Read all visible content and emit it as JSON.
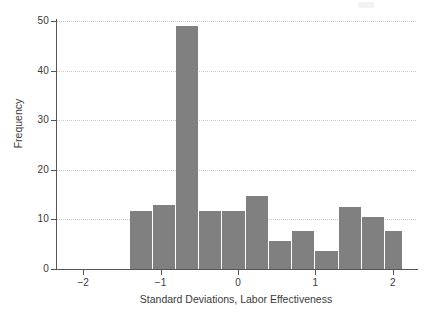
{
  "chart_data": {
    "type": "bar",
    "title": "",
    "subtitle": "",
    "xlabel": "Standard Deviations, Labor Effectiveness",
    "ylabel": "Frequency",
    "xlim": [
      -2.35,
      2.3
    ],
    "ylim": [
      0,
      50
    ],
    "xticks": [
      -2,
      -1,
      0,
      1,
      2
    ],
    "xticklabels": [
      "−2",
      "−1",
      "0",
      "1",
      "2"
    ],
    "yticks": [
      0,
      10,
      20,
      30,
      40,
      50
    ],
    "yticklabels": [
      "0",
      "10",
      "20",
      "30",
      "40",
      "50"
    ],
    "grid": "horizontal-dotted",
    "legend": "none",
    "bar_color": "#808080",
    "bin_width": 0.3,
    "bin_edges": [
      -1.4,
      -1.1,
      -0.8,
      -0.5,
      -0.2,
      0.1,
      0.4,
      0.7,
      1.0,
      1.3,
      1.6,
      1.9,
      2.13
    ],
    "bin_centers": [
      -1.25,
      -0.95,
      -0.65,
      -0.35,
      -0.05,
      0.25,
      0.55,
      0.85,
      1.15,
      1.45,
      1.75,
      2.01
    ],
    "values": [
      11.6,
      12.8,
      49.0,
      11.6,
      11.6,
      14.6,
      5.6,
      7.5,
      3.5,
      12.5,
      10.5,
      7.5
    ],
    "bars": [
      {
        "left": -1.4,
        "right": -1.1,
        "value": 11.6
      },
      {
        "left": -1.1,
        "right": -0.8,
        "value": 12.8
      },
      {
        "left": -0.8,
        "right": -0.5,
        "value": 49.0
      },
      {
        "left": -0.5,
        "right": -0.2,
        "value": 11.6
      },
      {
        "left": -0.2,
        "right": 0.1,
        "value": 11.6
      },
      {
        "left": 0.1,
        "right": 0.4,
        "value": 14.6
      },
      {
        "left": 0.4,
        "right": 0.7,
        "value": 5.6
      },
      {
        "left": 0.7,
        "right": 1.0,
        "value": 7.5
      },
      {
        "left": 1.0,
        "right": 1.3,
        "value": 3.5
      },
      {
        "left": 1.3,
        "right": 1.6,
        "value": 12.5
      },
      {
        "left": 1.6,
        "right": 1.9,
        "value": 10.5
      },
      {
        "left": 1.9,
        "right": 2.13,
        "value": 7.5
      }
    ]
  }
}
